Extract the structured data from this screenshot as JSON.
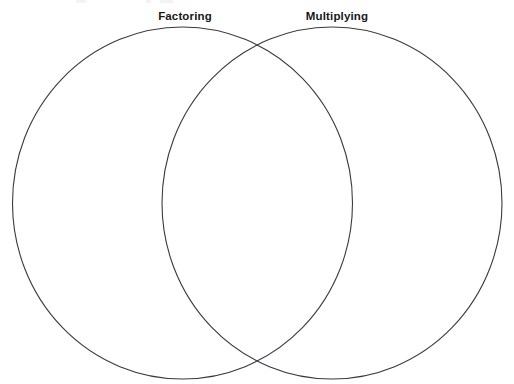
{
  "page": {
    "width": 514,
    "height": 384,
    "background_color": "#ffffff",
    "stroke_color": "#3a3a3e",
    "label_color": "#18181a"
  },
  "diagram": {
    "type": "venn-two-circle",
    "name": "blank-venn-diagram",
    "left_circle": {
      "label": "Factoring",
      "cx": 182.5,
      "cy": 203,
      "rx": 170,
      "ry": 176
    },
    "right_circle": {
      "label": "Multiplying",
      "cx": 332,
      "cy": 203,
      "rx": 170,
      "ry": 176
    },
    "regions": {
      "left_only": "",
      "overlap": "",
      "right_only": ""
    }
  }
}
